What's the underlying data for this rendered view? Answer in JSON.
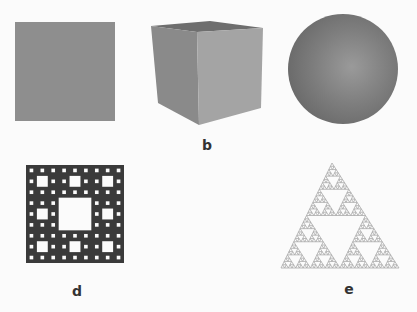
{
  "figure": {
    "panels": [
      {
        "id": "a",
        "shape": "square",
        "label": ""
      },
      {
        "id": "b",
        "shape": "cube",
        "label": "b"
      },
      {
        "id": "c",
        "shape": "sphere",
        "label": ""
      },
      {
        "id": "d",
        "shape": "sierpinski-carpet",
        "label": "d",
        "iterations": 3
      },
      {
        "id": "e",
        "shape": "sierpinski-triangle",
        "label": "e",
        "iterations": 5
      }
    ],
    "labels": {
      "b": "b",
      "d": "d",
      "e": "e"
    }
  },
  "colors": {
    "square": "#8e8e8e",
    "cube_top": "#6e6e6e",
    "cube_left": "#8a8a8a",
    "cube_right": "#a4a4a4",
    "carpet": "#3a3a3a",
    "triangle_stroke": "#a9a9a9",
    "label": "#333333"
  }
}
